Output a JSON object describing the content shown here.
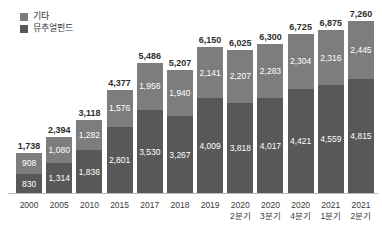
{
  "legend": {
    "items": [
      {
        "label": "기타",
        "color": "#7d7d7d",
        "key": "other"
      },
      {
        "label": "뮤추얼펀드",
        "color": "#585858",
        "key": "mutual_fund"
      }
    ]
  },
  "chart_data": {
    "type": "bar",
    "subtype": "stacked-vertical",
    "title": "",
    "xlabel": "",
    "ylabel": "",
    "grid": false,
    "legend_position": "top-left",
    "axis_visible": {
      "x": true,
      "y": false
    },
    "ylim": [
      0,
      7260
    ],
    "categories": [
      "2000",
      "2005",
      "2010",
      "2015",
      "2017",
      "2018",
      "2019",
      "2020 2분기",
      "2020 3분기",
      "2020 4분기",
      "2021 1분기",
      "2021 2분기"
    ],
    "category_lines": [
      [
        "2000",
        ""
      ],
      [
        "2005",
        ""
      ],
      [
        "2010",
        ""
      ],
      [
        "2015",
        ""
      ],
      [
        "2017",
        ""
      ],
      [
        "2018",
        ""
      ],
      [
        "2019",
        ""
      ],
      [
        "2020",
        "2분기"
      ],
      [
        "2020",
        "3분기"
      ],
      [
        "2020",
        "4분기"
      ],
      [
        "2021",
        "1분기"
      ],
      [
        "2021",
        "2분기"
      ]
    ],
    "series": [
      {
        "name": "기타",
        "color": "#7d7d7d",
        "values": [
          908,
          1080,
          1282,
          1576,
          1956,
          1940,
          2141,
          2207,
          2283,
          2304,
          2316,
          2445
        ],
        "labels": [
          "908",
          "1,080",
          "1,282",
          "1,576",
          "1,956",
          "1,940",
          "2,141",
          "2,207",
          "2,283",
          "2,304",
          "2,316",
          "2,445"
        ]
      },
      {
        "name": "뮤추얼펀드",
        "color": "#585858",
        "values": [
          830,
          1314,
          1836,
          2801,
          3530,
          3267,
          4009,
          3818,
          4017,
          4421,
          4559,
          4815
        ],
        "labels": [
          "830",
          "1,314",
          "1,836",
          "2,801",
          "3,530",
          "3,267",
          "4,009",
          "3,818",
          "4,017",
          "4,421",
          "4,559",
          "4,815"
        ]
      }
    ],
    "totals": [
      1738,
      2394,
      3118,
      4377,
      5486,
      5207,
      6150,
      6025,
      6300,
      6725,
      6875,
      7260
    ],
    "total_labels": [
      "1,738",
      "2,394",
      "3,118",
      "4,377",
      "5,486",
      "5,207",
      "6,150",
      "6,025",
      "6,300",
      "6,725",
      "6,875",
      "7,260"
    ]
  }
}
